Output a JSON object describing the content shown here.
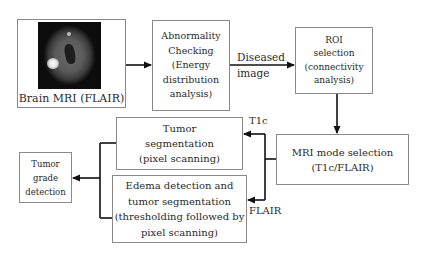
{
  "diagram": {
    "nodes": {
      "brain_mri": {
        "caption": "Brain MRI (FLAIR)",
        "image": "brain-mri-flair-scan"
      },
      "abnormality": {
        "lines": [
          "Abnormality",
          "Checking",
          "(Energy",
          "distribution",
          "analysis)"
        ]
      },
      "roi": {
        "lines": [
          "ROI",
          "selection",
          "(connectivity",
          "analysis)"
        ]
      },
      "mri_mode": {
        "lines": [
          "MRI mode selection",
          "(T1c/FLAIR)"
        ]
      },
      "tumor_seg": {
        "lines": [
          "Tumor",
          "segmentation",
          "(pixel scanning)"
        ]
      },
      "edema": {
        "lines": [
          "Edema detection and",
          "tumor segmentation",
          "(thresholding followed by",
          "pixel scanning)"
        ]
      },
      "tumor_grade": {
        "lines": [
          "Tumor",
          "grade",
          "detection"
        ]
      }
    },
    "edge_labels": {
      "diseased_line1": "Diseased",
      "diseased_line2": "image",
      "t1c": "T1c",
      "flair": "FLAIR"
    },
    "colors": {
      "box_border": "#8a8a8a",
      "arrow": "#111111",
      "text": "#2a2a2a"
    }
  }
}
